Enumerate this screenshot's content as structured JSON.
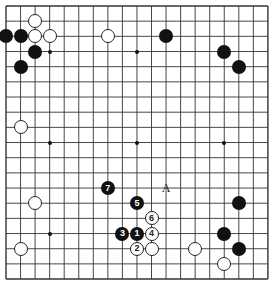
{
  "board": {
    "size": 19,
    "origin_x": 6,
    "origin_y": 6,
    "step_x": 14.55,
    "step_y": 15.17,
    "line_color": "#333333",
    "hoshi": [
      [
        3,
        3
      ],
      [
        9,
        3
      ],
      [
        15,
        3
      ],
      [
        3,
        9
      ],
      [
        9,
        9
      ],
      [
        15,
        9
      ],
      [
        3,
        15
      ],
      [
        9,
        15
      ],
      [
        15,
        15
      ]
    ]
  },
  "stones": [
    {
      "color": "white",
      "col": 2,
      "row": 1,
      "label": ""
    },
    {
      "color": "black",
      "col": 0,
      "row": 2,
      "label": ""
    },
    {
      "color": "black",
      "col": 1,
      "row": 2,
      "label": ""
    },
    {
      "color": "white",
      "col": 2,
      "row": 2,
      "label": ""
    },
    {
      "color": "white",
      "col": 3,
      "row": 2,
      "label": ""
    },
    {
      "color": "white",
      "col": 7,
      "row": 2,
      "label": ""
    },
    {
      "color": "black",
      "col": 2,
      "row": 3,
      "label": ""
    },
    {
      "color": "black",
      "col": 1,
      "row": 4,
      "label": ""
    },
    {
      "color": "black",
      "col": 11,
      "row": 2,
      "label": ""
    },
    {
      "color": "black",
      "col": 15,
      "row": 3,
      "label": ""
    },
    {
      "color": "black",
      "col": 16,
      "row": 4,
      "label": ""
    },
    {
      "color": "white",
      "col": 1,
      "row": 8,
      "label": ""
    },
    {
      "color": "black",
      "col": 7,
      "row": 12,
      "label": "7"
    },
    {
      "color": "black",
      "col": 9,
      "row": 13,
      "label": "5"
    },
    {
      "color": "white",
      "col": 10,
      "row": 14,
      "label": "6"
    },
    {
      "color": "black",
      "col": 8,
      "row": 15,
      "label": "3"
    },
    {
      "color": "black",
      "col": 9,
      "row": 15,
      "label": "1"
    },
    {
      "color": "white",
      "col": 10,
      "row": 15,
      "label": "4"
    },
    {
      "color": "white",
      "col": 9,
      "row": 16,
      "label": "2"
    },
    {
      "color": "white",
      "col": 10,
      "row": 16,
      "label": ""
    },
    {
      "color": "white",
      "col": 2,
      "row": 13,
      "label": ""
    },
    {
      "color": "white",
      "col": 1,
      "row": 16,
      "label": ""
    },
    {
      "color": "black",
      "col": 16,
      "row": 13,
      "label": ""
    },
    {
      "color": "black",
      "col": 15,
      "row": 15,
      "label": ""
    },
    {
      "color": "black",
      "col": 16,
      "row": 16,
      "label": ""
    },
    {
      "color": "white",
      "col": 13,
      "row": 16,
      "label": ""
    },
    {
      "color": "white",
      "col": 15,
      "row": 17,
      "label": ""
    }
  ],
  "labels": [
    {
      "text": "A",
      "col": 11,
      "row": 12
    }
  ]
}
